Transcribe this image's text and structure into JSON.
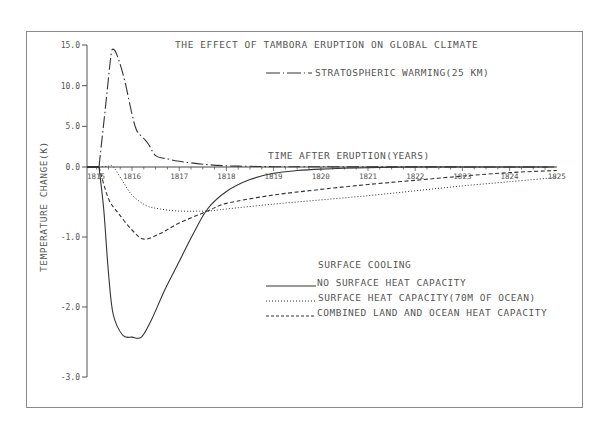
{
  "chart_data": {
    "type": "line",
    "title": "THE EFFECT OF TAMBORA ERUPTION ON GLOBAL CLIMATE",
    "xlabel": "TIME AFTER ERUPTION(YEARS)",
    "ylabel": "TEMPERATURE CHANGE(K)",
    "x_ticks": [
      "1815",
      "1816",
      "1817",
      "1818",
      "1819",
      "1820",
      "1821",
      "1822",
      "1823",
      "1824",
      "1825"
    ],
    "y_ticks": [
      "15.0",
      "10.0",
      "5.0",
      "0.0",
      "-1.0",
      "-2.0",
      "-3.0"
    ],
    "y_scale_note": "piecewise: 0 to 15 compressed (5 K per tick), 0 to -3 expanded (1 K per tick)",
    "xlim": [
      1815.3,
      1825
    ],
    "ylim": [
      -3,
      15
    ],
    "grid": false,
    "legend_heading": "SURFACE COOLING",
    "series": [
      {
        "name": "STRATOSPHERIC WARMING(25 KM)",
        "style": "dash-dot",
        "x": [
          1815.3,
          1815.45,
          1815.55,
          1815.6,
          1815.7,
          1815.85,
          1816.0,
          1816.1,
          1816.25,
          1816.35,
          1816.5,
          1816.75,
          1817.0,
          1817.5,
          1818.0,
          1818.5,
          1819.0,
          1820.0,
          1822.0,
          1825.0
        ],
        "values": [
          0.0,
          8.0,
          13.5,
          14.5,
          13.5,
          10.5,
          6.5,
          4.5,
          3.5,
          2.8,
          1.4,
          1.0,
          0.7,
          0.35,
          0.15,
          0.08,
          0.04,
          0.02,
          0.01,
          0.0
        ]
      },
      {
        "name": "NO SURFACE HEAT CAPACITY",
        "style": "solid",
        "x": [
          1815.3,
          1815.4,
          1815.5,
          1815.6,
          1815.8,
          1816.0,
          1816.2,
          1816.4,
          1816.7,
          1817.0,
          1817.3,
          1817.6,
          1818.0,
          1818.5,
          1819.0,
          1819.5,
          1820.0,
          1821.0,
          1822.0,
          1823.0,
          1825.0
        ],
        "values": [
          0.0,
          -0.6,
          -1.5,
          -2.1,
          -2.4,
          -2.43,
          -2.43,
          -2.2,
          -1.75,
          -1.35,
          -0.95,
          -0.6,
          -0.35,
          -0.18,
          -0.09,
          -0.05,
          -0.03,
          -0.01,
          0.0,
          0.0,
          0.0
        ]
      },
      {
        "name": "SURFACE HEAT CAPACITY(70M OF OCEAN)",
        "style": "dotted",
        "x": [
          1815.3,
          1815.5,
          1815.6,
          1815.8,
          1816.0,
          1816.3,
          1816.6,
          1817.0,
          1817.4,
          1817.6,
          1818.0,
          1819.0,
          1820.0,
          1821.0,
          1822.0,
          1823.0,
          1824.0,
          1825.0
        ],
        "values": [
          0.0,
          0.1,
          0.05,
          -0.2,
          -0.4,
          -0.55,
          -0.6,
          -0.63,
          -0.63,
          -0.63,
          -0.6,
          -0.53,
          -0.47,
          -0.41,
          -0.34,
          -0.27,
          -0.21,
          -0.15
        ]
      },
      {
        "name": "COMBINED LAND AND OCEAN HEAT CAPACITY",
        "style": "dashed",
        "x": [
          1815.3,
          1815.5,
          1815.7,
          1816.0,
          1816.25,
          1816.6,
          1817.0,
          1817.6,
          1818.0,
          1819.0,
          1820.0,
          1821.0,
          1822.0,
          1823.0,
          1824.0,
          1825.0
        ],
        "values": [
          0.0,
          -0.45,
          -0.65,
          -0.9,
          -1.03,
          -0.95,
          -0.8,
          -0.63,
          -0.52,
          -0.4,
          -0.32,
          -0.25,
          -0.19,
          -0.13,
          -0.08,
          -0.05
        ]
      }
    ]
  },
  "labels": {
    "title": "THE EFFECT OF TAMBORA ERUPTION ON GLOBAL CLIMATE",
    "xlabel": "TIME AFTER ERUPTION(YEARS)",
    "ylabel": "TEMPERATURE CHANGE(K)",
    "strat_legend": "STRATOSPHERIC WARMING(25 KM)",
    "legend_heading": "SURFACE COOLING",
    "legend_1": "NO SURFACE HEAT CAPACITY",
    "legend_2": "SURFACE HEAT CAPACITY(70M OF OCEAN)",
    "legend_3": "COMBINED LAND AND OCEAN HEAT CAPACITY"
  },
  "colors": {
    "line": "#333333",
    "frame": "#8a8a8a",
    "text": "#555555"
  }
}
